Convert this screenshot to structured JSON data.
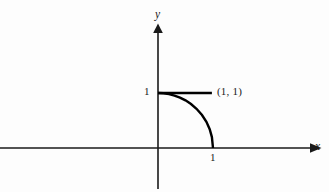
{
  "figure": {
    "background_color": "#fdfdfd",
    "ink_color": "#000000",
    "axis_color": "#1a1a1a",
    "width": 329,
    "height": 192
  },
  "axes": {
    "x_axis_label": "x",
    "y_axis_label": "y",
    "x_axis_arrow": "arrow-right",
    "y_axis_arrow": "arrow-up",
    "origin_px": {
      "x": 158,
      "y": 148
    },
    "unit_px": 55
  },
  "ticks": {
    "y": [
      {
        "value": "1",
        "label": "1"
      }
    ],
    "x": [
      {
        "value": "1",
        "label": "1"
      }
    ]
  },
  "annotations": [
    {
      "id": "corner-point",
      "label": "(1, 1)"
    }
  ],
  "chart_data": {
    "type": "line",
    "title": "",
    "xlabel": "x",
    "ylabel": "y",
    "xlim": [
      -2.87,
      2.76
    ],
    "ylim": [
      -0.73,
      2.22
    ],
    "grid": false,
    "legend": null,
    "xticks": [
      1
    ],
    "xticklabels": [
      "1"
    ],
    "yticks": [
      1
    ],
    "yticklabels": [
      "1"
    ],
    "annotations": [
      {
        "text": "(1, 1)",
        "x": 1.09,
        "y": 1.02
      }
    ],
    "series": [
      {
        "name": "horizontal-segment-y-equals-1",
        "type": "line",
        "x": [
          0,
          0.98
        ],
        "y": [
          1,
          1
        ]
      },
      {
        "name": "quarter-arc-from-0-1-to-1-0",
        "type": "line",
        "x": [
          0.0,
          0.1,
          0.2,
          0.3,
          0.4,
          0.5,
          0.6,
          0.7,
          0.8,
          0.88,
          0.94,
          0.98,
          1.0
        ],
        "y": [
          1.0,
          0.995,
          0.98,
          0.954,
          0.917,
          0.866,
          0.8,
          0.714,
          0.6,
          0.475,
          0.341,
          0.199,
          0.0
        ]
      }
    ]
  }
}
